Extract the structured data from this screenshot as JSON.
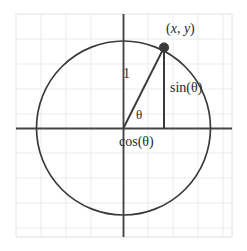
{
  "figure": {
    "type": "geometry-diagram",
    "background_color": "#ffffff",
    "grid": {
      "visible": true,
      "color": "#e9e9e9",
      "spacing_px": 25,
      "border_color": "#e0e0e0",
      "box": {
        "x": 16,
        "y": 14,
        "width": 216,
        "height": 223
      }
    },
    "axes": {
      "color": "#454545",
      "stroke_width": 1.8,
      "origin": {
        "x": 123,
        "y": 128
      },
      "x_axis": {
        "from_x": 16,
        "to_x": 232,
        "y": 128
      },
      "y_axis": {
        "x": 123,
        "from_y": 14,
        "to_y": 237
      }
    },
    "circle": {
      "label": "unit circle",
      "center": {
        "x": 123,
        "y": 128
      },
      "radius": 87,
      "stroke_color": "#3a3a3a",
      "stroke_width": 1.6,
      "fill": "none"
    },
    "point": {
      "label": "(x, y)",
      "label_x_text": "x",
      "label_y_text": "y",
      "x": 164,
      "y": 47,
      "dot_radius": 4.6,
      "dot_color": "#3a3a3a"
    },
    "radius_segment": {
      "label": "1",
      "from": {
        "x": 123,
        "y": 128
      },
      "to": {
        "x": 164,
        "y": 47
      },
      "color": "#3a3a3a",
      "stroke_width": 1.8
    },
    "sine_segment": {
      "label": "sin(θ)",
      "from": {
        "x": 164,
        "y": 47
      },
      "to": {
        "x": 164,
        "y": 128
      },
      "color": "#3a3a3a",
      "stroke_width": 1.8
    },
    "cosine_segment": {
      "label": "cos(θ)",
      "from": {
        "x": 123,
        "y": 128
      },
      "to": {
        "x": 164,
        "y": 128
      }
    },
    "angle": {
      "label": "θ",
      "vertex": {
        "x": 123,
        "y": 128
      },
      "measure_degrees": 63
    }
  },
  "labels": {
    "point_coords_open": "(",
    "point_coords_x": "x",
    "point_coords_comma": ", ",
    "point_coords_y": "y",
    "point_coords_close": ")",
    "radius": "1",
    "angle": "θ",
    "sine": "sin(θ)",
    "cosine": "cos(θ)"
  }
}
